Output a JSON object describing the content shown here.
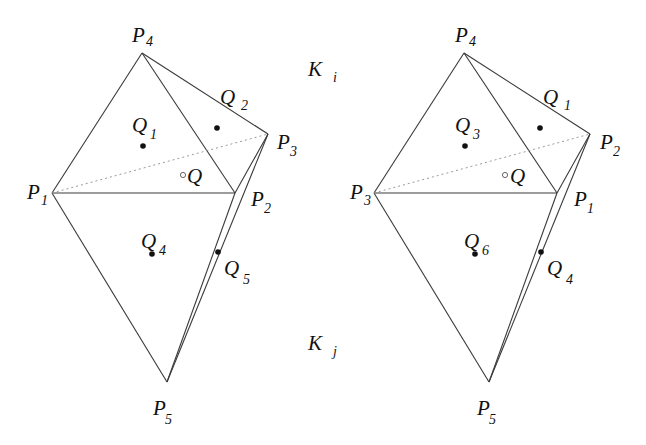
{
  "diagram": {
    "left": {
      "vertices": [
        {
          "name": "P",
          "sub": "4",
          "x": 142,
          "y": 53,
          "lx": 132,
          "ly": 42,
          "sx": 146,
          "sy": 46
        },
        {
          "name": "P",
          "sub": "1",
          "x": 52,
          "y": 193,
          "lx": 27,
          "ly": 199,
          "sx": 41,
          "sy": 205
        },
        {
          "name": "P",
          "sub": "2",
          "x": 235,
          "y": 193,
          "lx": 251,
          "ly": 206,
          "sx": 264,
          "sy": 213
        },
        {
          "name": "P",
          "sub": "3",
          "x": 268,
          "y": 134,
          "lx": 277,
          "ly": 149,
          "sx": 290,
          "sy": 156
        },
        {
          "name": "P",
          "sub": "5",
          "x": 167,
          "y": 382,
          "lx": 153,
          "ly": 415,
          "sx": 165,
          "sy": 424
        }
      ],
      "points": [
        {
          "name": "Q",
          "sub": "1",
          "x": 143,
          "y": 146,
          "lx": 132,
          "ly": 132,
          "sx": 150,
          "sy": 139,
          "type": "dot"
        },
        {
          "name": "Q",
          "sub": "2",
          "x": 217,
          "y": 128,
          "lx": 220,
          "ly": 104,
          "sx": 241,
          "sy": 110,
          "type": "dot"
        },
        {
          "name": "Q",
          "sub": "",
          "x": 183,
          "y": 175,
          "lx": 187,
          "ly": 183,
          "sx": 0,
          "sy": 0,
          "type": "hollow"
        },
        {
          "name": "Q",
          "sub": "4",
          "x": 152,
          "y": 254,
          "lx": 141,
          "ly": 248,
          "sx": 159,
          "sy": 255,
          "type": "dot"
        },
        {
          "name": "Q",
          "sub": "5",
          "x": 218,
          "y": 252,
          "lx": 224,
          "ly": 275,
          "sx": 243,
          "sy": 284,
          "type": "dot"
        }
      ]
    },
    "right": {
      "vertices": [
        {
          "name": "P",
          "sub": "4",
          "x": 464,
          "y": 53,
          "lx": 455,
          "ly": 42,
          "sx": 469,
          "sy": 46
        },
        {
          "name": "P",
          "sub": "3",
          "x": 374,
          "y": 193,
          "lx": 350,
          "ly": 199,
          "sx": 364,
          "sy": 205
        },
        {
          "name": "P",
          "sub": "1",
          "x": 557,
          "y": 193,
          "lx": 574,
          "ly": 206,
          "sx": 587,
          "sy": 213
        },
        {
          "name": "P",
          "sub": "2",
          "x": 590,
          "y": 134,
          "lx": 600,
          "ly": 149,
          "sx": 613,
          "sy": 156
        },
        {
          "name": "P",
          "sub": "5",
          "x": 489,
          "y": 382,
          "lx": 477,
          "ly": 415,
          "sx": 489,
          "sy": 424
        }
      ],
      "points": [
        {
          "name": "Q",
          "sub": "3",
          "x": 465,
          "y": 146,
          "lx": 455,
          "ly": 132,
          "sx": 473,
          "sy": 139,
          "type": "dot"
        },
        {
          "name": "Q",
          "sub": "1",
          "x": 540,
          "y": 128,
          "lx": 543,
          "ly": 104,
          "sx": 564,
          "sy": 110,
          "type": "dot"
        },
        {
          "name": "Q",
          "sub": "",
          "x": 505,
          "y": 175,
          "lx": 510,
          "ly": 183,
          "sx": 0,
          "sy": 0,
          "type": "hollow"
        },
        {
          "name": "Q",
          "sub": "6",
          "x": 475,
          "y": 254,
          "lx": 464,
          "ly": 248,
          "sx": 482,
          "sy": 255,
          "type": "dot"
        },
        {
          "name": "Q",
          "sub": "4",
          "x": 541,
          "y": 252,
          "lx": 547,
          "ly": 275,
          "sx": 566,
          "sy": 284,
          "type": "dot"
        }
      ]
    },
    "element_labels": [
      {
        "name": "K",
        "sub": "i",
        "lx": 308,
        "ly": 76,
        "sx": 333,
        "sy": 82
      },
      {
        "name": "K",
        "sub": "j",
        "lx": 308,
        "ly": 350,
        "sx": 333,
        "sy": 356
      }
    ]
  }
}
